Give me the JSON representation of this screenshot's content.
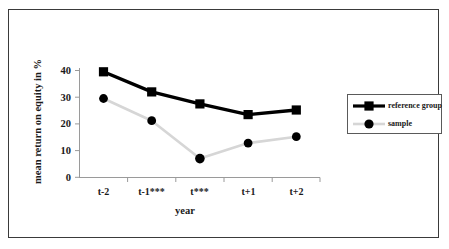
{
  "chart_data": {
    "type": "line",
    "title": "",
    "xlabel": "year",
    "ylabel": "mean return on equity in %",
    "categories": [
      "t-2",
      "t-1***",
      "t***",
      "t+1",
      "t+2"
    ],
    "ylim": [
      0,
      40
    ],
    "yticks": [
      0,
      10,
      20,
      30,
      40
    ],
    "ytick_labels": [
      "0",
      "10",
      "20",
      "30",
      "40"
    ],
    "grid": false,
    "legend_position": "right",
    "series": [
      {
        "name": "reference group",
        "values": [
          39.5,
          32.0,
          27.5,
          23.5,
          25.2
        ],
        "color": "#000000",
        "marker": "square",
        "line_width": 3
      },
      {
        "name": "sample",
        "values": [
          29.5,
          21.2,
          7.0,
          12.8,
          15.2
        ],
        "color": "#d4d4d4",
        "marker": "circle",
        "marker_color": "#000000",
        "line_width": 2
      }
    ]
  },
  "axis": {
    "y_tick_labels": [
      "40",
      "30",
      "20",
      "10",
      "0"
    ],
    "x_tick_labels": [
      "t-2",
      "t-1***",
      "t***",
      "t+1",
      "t+2"
    ],
    "y_title": "mean return on equity in %",
    "x_title": "year"
  },
  "legend": {
    "entries": [
      {
        "label": "reference group"
      },
      {
        "label": "sample"
      }
    ]
  }
}
